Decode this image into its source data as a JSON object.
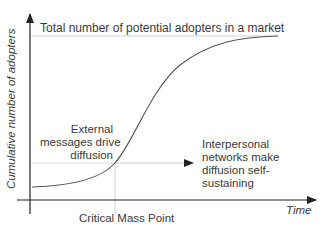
{
  "diagram": {
    "type": "s-curve",
    "y_axis_label": "Cumulative number of adopters",
    "x_axis_label": "Time",
    "ceiling_label": "Total number of potential adopters in a market",
    "left_annotation": [
      "External",
      "messages drive",
      "diffusion"
    ],
    "right_annotation": [
      "Interpersonal",
      "networks make",
      "diffusion self-",
      "sustaining"
    ],
    "critical_point_label": "Critical Mass Point",
    "colors": {
      "axis": "#222222",
      "curve": "#555555",
      "guide": "#cccccc",
      "text": "#3a3a3a"
    }
  }
}
